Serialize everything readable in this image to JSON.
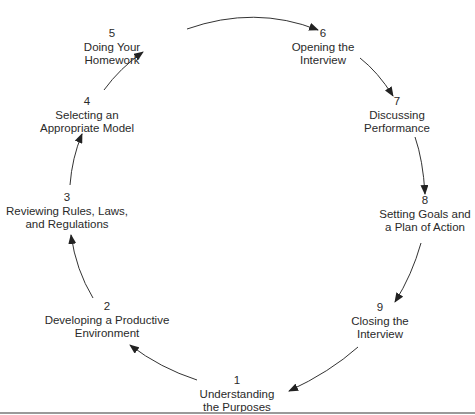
{
  "diagram": {
    "type": "cycle",
    "colors": {
      "text": "#2a2a2a",
      "arrow": "#222222",
      "rule": "#9a9a9a"
    },
    "nodes": [
      {
        "number": "1",
        "line1": "Understanding",
        "line2": "the Purposes"
      },
      {
        "number": "2",
        "line1": "Developing a Productive",
        "line2": "Environment"
      },
      {
        "number": "3",
        "line1": "Reviewing Rules, Laws,",
        "line2": "and Regulations"
      },
      {
        "number": "4",
        "line1": "Selecting an",
        "line2": "Appropriate Model"
      },
      {
        "number": "5",
        "line1": "Doing Your",
        "line2": "Homework"
      },
      {
        "number": "6",
        "line1": "Opening the",
        "line2": "Interview"
      },
      {
        "number": "7",
        "line1": "Discussing",
        "line2": "Performance"
      },
      {
        "number": "8",
        "line1": "Setting Goals and",
        "line2": "a Plan of Action"
      },
      {
        "number": "9",
        "line1": "Closing the",
        "line2": "Interview"
      }
    ],
    "edges": [
      {
        "from": "1",
        "to": "2"
      },
      {
        "from": "2",
        "to": "3"
      },
      {
        "from": "3",
        "to": "4"
      },
      {
        "from": "4",
        "to": "5"
      },
      {
        "from": "5",
        "to": "6"
      },
      {
        "from": "6",
        "to": "7"
      },
      {
        "from": "7",
        "to": "8"
      },
      {
        "from": "8",
        "to": "9"
      },
      {
        "from": "9",
        "to": "1"
      }
    ]
  }
}
